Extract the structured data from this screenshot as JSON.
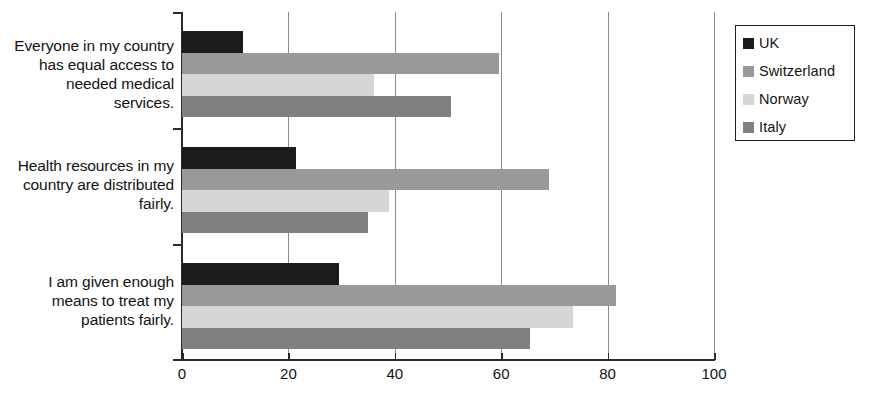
{
  "chart_data": {
    "type": "bar",
    "orientation": "horizontal",
    "title": "",
    "xlabel": "",
    "ylabel": "",
    "xlim": [
      0,
      100
    ],
    "xticks": [
      0,
      20,
      40,
      60,
      80,
      100
    ],
    "xtick_labels": [
      "0",
      "20",
      "40",
      "60",
      "80",
      "100"
    ],
    "grid": "vertical gridlines at 20, 40, 60, 80, 100",
    "legend_position": "right",
    "categories": [
      "Everyone in my country has equal access to needed medical services.",
      "Health resources in my country are distributed fairly.",
      "I am given enough means to treat my patients fairly."
    ],
    "series": [
      {
        "name": "UK",
        "color": "#1b1b1b",
        "values": [
          11.5,
          21.5,
          29.5
        ]
      },
      {
        "name": "Switzerland",
        "color": "#999999",
        "values": [
          59.5,
          69.0,
          81.5
        ]
      },
      {
        "name": "Norway",
        "color": "#d6d6d6",
        "values": [
          36.0,
          39.0,
          73.5
        ]
      },
      {
        "name": "Italy",
        "color": "#808080",
        "values": [
          50.5,
          35.0,
          65.5
        ]
      }
    ]
  },
  "axis": {
    "line_color": "#2b2b2b",
    "grid_color": "#8d8d8d"
  },
  "legend": {
    "items": [
      {
        "label": "UK",
        "color": "#1b1b1b"
      },
      {
        "label": "Switzerland",
        "color": "#999999"
      },
      {
        "label": "Norway",
        "color": "#d6d6d6"
      },
      {
        "label": "Italy",
        "color": "#808080"
      }
    ]
  }
}
